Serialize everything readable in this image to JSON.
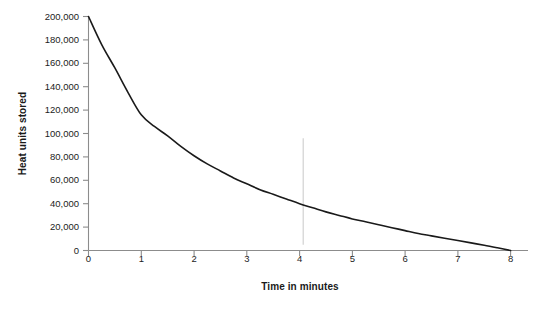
{
  "chart_data": {
    "type": "line",
    "title": "",
    "xlabel": "Time in minutes",
    "ylabel": "Heat units stored",
    "xlim": [
      0,
      8
    ],
    "ylim": [
      0,
      200000
    ],
    "grid": false,
    "legend": null,
    "x_ticks": [
      "0",
      "1",
      "2",
      "3",
      "4",
      "5",
      "6",
      "7",
      "8"
    ],
    "x_tick_values": [
      0,
      1,
      2,
      3,
      4,
      5,
      6,
      7,
      8
    ],
    "y_ticks": [
      "0",
      "20,000",
      "40,000",
      "60,000",
      "80,000",
      "100,000",
      "120,000",
      "140,000",
      "160,000",
      "180,000",
      "200,000"
    ],
    "y_tick_values": [
      0,
      20000,
      40000,
      60000,
      80000,
      100000,
      120000,
      140000,
      160000,
      180000,
      200000
    ],
    "series": [
      {
        "name": "Heat units stored",
        "color": "#1a1a1a",
        "x": [
          0,
          0.25,
          0.5,
          0.75,
          1,
          1.25,
          1.5,
          1.75,
          2,
          2.25,
          2.5,
          2.75,
          3,
          3.25,
          3.5,
          3.75,
          4,
          4.25,
          4.5,
          4.75,
          5,
          5.25,
          5.5,
          5.75,
          6,
          6.25,
          6.5,
          6.75,
          7,
          7.25,
          7.5,
          7.75,
          8
        ],
        "values": [
          200000,
          176000,
          156000,
          135000,
          116000,
          106000,
          98000,
          89000,
          81000,
          74000,
          68000,
          62000,
          57000,
          52000,
          48000,
          44000,
          40000,
          36500,
          33000,
          30000,
          27000,
          24500,
          22000,
          19500,
          17000,
          14500,
          12500,
          10500,
          8500,
          6500,
          4500,
          2300,
          0
        ]
      }
    ],
    "annotations": [
      {
        "name": "faint-vertical-marker",
        "x": 4.07,
        "y_from": 96000,
        "y_to": 5000,
        "color": "#d8d8d8"
      }
    ]
  },
  "axis": {
    "y_title": "Heat units stored",
    "x_title": "Time in minutes"
  },
  "caption": {
    "text": ""
  },
  "colors": {
    "curve": "#1a1a1a",
    "axis": "#8c8c8c",
    "tick_text": "#1c1c1c",
    "marker": "#d8d8d8",
    "background": "#ffffff"
  }
}
